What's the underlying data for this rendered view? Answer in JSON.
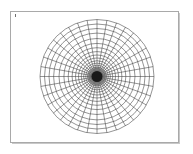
{
  "figure": {
    "title": "",
    "background_color": "#ffffff",
    "frame": {
      "name": "plot-frame",
      "border_color": "#a9a9a9",
      "shadow_color": "#c8c8c8",
      "x": 10,
      "y": 11,
      "width": 169,
      "height": 132
    },
    "corner_tick": {
      "name": "corner-tick-mark",
      "x": 15,
      "y": 14,
      "color": "#707070"
    }
  },
  "chart_data": {
    "type": "line",
    "title": "",
    "subtitle": "",
    "xlabel": "",
    "ylabel": "",
    "grid": true,
    "legend": [],
    "legend_position": "none",
    "coordinate_system": "polar",
    "center": {
      "x": 97,
      "y": 76.5
    },
    "outer_radius": 57,
    "radial_spokes": {
      "count": 36,
      "angular_step_deg": 10,
      "angles_deg": [
        0,
        10,
        20,
        30,
        40,
        50,
        60,
        70,
        80,
        90,
        100,
        110,
        120,
        130,
        140,
        150,
        160,
        170,
        180,
        190,
        200,
        210,
        220,
        230,
        240,
        250,
        260,
        270,
        280,
        290,
        300,
        310,
        320,
        330,
        340,
        350
      ],
      "color": "#3c3c3c",
      "line_width": 0.55
    },
    "rings": {
      "count": 22,
      "spacing": "geometric",
      "growth_ratio": 1.175,
      "radii": [
        1.2,
        1.9,
        2.6,
        3.4,
        4.3,
        5.3,
        6.5,
        7.9,
        9.5,
        11.3,
        13.4,
        15.8,
        18.5,
        21.5,
        24.9,
        28.8,
        33.1,
        38.0,
        43.4,
        48.0,
        52.5,
        57.0
      ],
      "color": "#3c3c3c",
      "line_width": 0.55
    },
    "core": {
      "name": "dense-center-core",
      "radius": 5.5,
      "fill_color": "#1a1a1a",
      "halo_radius": 9.5,
      "halo_color": "#6b6b6b"
    },
    "x": [
      -57,
      57
    ],
    "y": [
      -57,
      57
    ],
    "xlim": [
      -57,
      57
    ],
    "ylim": [
      -57,
      57
    ]
  }
}
